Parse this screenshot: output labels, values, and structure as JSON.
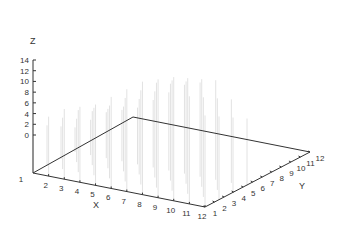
{
  "chart_data": {
    "type": "3d-stem",
    "title": "",
    "xlabel": "X",
    "ylabel": "Y",
    "zlabel": "Z",
    "x_ticks": [
      "1",
      "2",
      "3",
      "4",
      "5",
      "6",
      "7",
      "8",
      "9",
      "10",
      "11",
      "12"
    ],
    "y_ticks": [
      "1",
      "2",
      "3",
      "4",
      "5",
      "6",
      "7",
      "8",
      "9",
      "10",
      "11",
      "12"
    ],
    "z_ticks": [
      "0",
      "2",
      "4",
      "6",
      "8",
      "10",
      "12",
      "14"
    ],
    "zlim": [
      0,
      14
    ],
    "grid": false,
    "legend": null,
    "note": "Faint vertical stems rise from the X axis; heights increase with X, peaking near the back around Z≈14-16",
    "series": [
      {
        "name": "stems",
        "x": [
          1,
          2,
          3,
          4,
          5,
          6,
          7,
          8,
          9,
          10,
          11,
          12
        ],
        "z": [
          2,
          4,
          6,
          7,
          8,
          10,
          12,
          14,
          15,
          16,
          13,
          10
        ]
      }
    ]
  },
  "colors": {
    "axis": "#333333",
    "stem": "#dddddd",
    "background": "#ffffff"
  }
}
